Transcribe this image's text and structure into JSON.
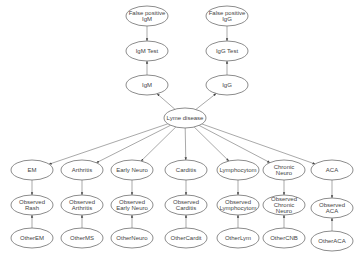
{
  "diagram": {
    "type": "bayesian-network",
    "background": "#ffffff",
    "stroke_color": "#6e6e6e",
    "text_color": "#444444",
    "nodes": [
      {
        "id": "fp_igm",
        "lines": [
          "False positive",
          "IgM"
        ],
        "cx": 147,
        "cy": 16,
        "rx": 21,
        "ry": 10
      },
      {
        "id": "igm_test",
        "lines": [
          "IgM Test"
        ],
        "cx": 147,
        "cy": 51,
        "rx": 21,
        "ry": 10
      },
      {
        "id": "igm",
        "lines": [
          "IgM"
        ],
        "cx": 147,
        "cy": 85,
        "rx": 21,
        "ry": 10
      },
      {
        "id": "fp_igg",
        "lines": [
          "False positive",
          "IgG"
        ],
        "cx": 227,
        "cy": 16,
        "rx": 21,
        "ry": 10
      },
      {
        "id": "igg_test",
        "lines": [
          "IgG Test"
        ],
        "cx": 227,
        "cy": 51,
        "rx": 21,
        "ry": 10
      },
      {
        "id": "igg",
        "lines": [
          "IgG"
        ],
        "cx": 227,
        "cy": 85,
        "rx": 21,
        "ry": 10
      },
      {
        "id": "lyme",
        "lines": [
          "Lyme disease"
        ],
        "cx": 185,
        "cy": 118,
        "rx": 21,
        "ry": 10
      },
      {
        "id": "em",
        "lines": [
          "EM"
        ],
        "cx": 32,
        "cy": 170,
        "rx": 21,
        "ry": 10
      },
      {
        "id": "arthritis",
        "lines": [
          "Arthritis"
        ],
        "cx": 82,
        "cy": 170,
        "rx": 21,
        "ry": 10
      },
      {
        "id": "early_neuro",
        "lines": [
          "Early Neuro"
        ],
        "cx": 132,
        "cy": 170,
        "rx": 21,
        "ry": 10
      },
      {
        "id": "carditis",
        "lines": [
          "Carditis"
        ],
        "cx": 186,
        "cy": 170,
        "rx": 21,
        "ry": 10
      },
      {
        "id": "lymphocytom",
        "lines": [
          "Lymphocytom"
        ],
        "cx": 238,
        "cy": 170,
        "rx": 21,
        "ry": 10
      },
      {
        "id": "chronic_neuro",
        "lines": [
          "Chronic",
          "Neuro"
        ],
        "cx": 284,
        "cy": 170,
        "rx": 21,
        "ry": 10
      },
      {
        "id": "aca",
        "lines": [
          "ACA"
        ],
        "cx": 332,
        "cy": 170,
        "rx": 21,
        "ry": 10
      },
      {
        "id": "obs_rash",
        "lines": [
          "Observed",
          "Rash"
        ],
        "cx": 32,
        "cy": 205,
        "rx": 21,
        "ry": 10
      },
      {
        "id": "obs_arthritis",
        "lines": [
          "Observed",
          "Arthritis"
        ],
        "cx": 82,
        "cy": 205,
        "rx": 21,
        "ry": 10
      },
      {
        "id": "obs_early_neuro",
        "lines": [
          "Observed",
          "Early Neuro"
        ],
        "cx": 132,
        "cy": 205,
        "rx": 21,
        "ry": 10
      },
      {
        "id": "obs_carditis",
        "lines": [
          "Observed",
          "Carditis"
        ],
        "cx": 186,
        "cy": 205,
        "rx": 21,
        "ry": 10
      },
      {
        "id": "obs_lymphocytom",
        "lines": [
          "Observed",
          "Lymphocytom"
        ],
        "cx": 238,
        "cy": 205,
        "rx": 21,
        "ry": 10
      },
      {
        "id": "obs_chronic_neuro",
        "lines": [
          "Observed",
          "Chronic",
          "Neuro"
        ],
        "cx": 284,
        "cy": 205,
        "rx": 21,
        "ry": 10
      },
      {
        "id": "obs_aca",
        "lines": [
          "Observed",
          "ACA"
        ],
        "cx": 332,
        "cy": 208,
        "rx": 21,
        "ry": 10
      },
      {
        "id": "other_em",
        "lines": [
          "OtherEM"
        ],
        "cx": 32,
        "cy": 238,
        "rx": 21,
        "ry": 10
      },
      {
        "id": "other_ms",
        "lines": [
          "OtherMS"
        ],
        "cx": 82,
        "cy": 238,
        "rx": 21,
        "ry": 10
      },
      {
        "id": "other_neuro",
        "lines": [
          "OtherNeuro"
        ],
        "cx": 132,
        "cy": 238,
        "rx": 21,
        "ry": 10
      },
      {
        "id": "other_cardit",
        "lines": [
          "OtherCardit"
        ],
        "cx": 186,
        "cy": 238,
        "rx": 21,
        "ry": 10
      },
      {
        "id": "other_lym",
        "lines": [
          "OtherLym"
        ],
        "cx": 238,
        "cy": 238,
        "rx": 21,
        "ry": 10
      },
      {
        "id": "other_cnb",
        "lines": [
          "OtherCNB"
        ],
        "cx": 284,
        "cy": 238,
        "rx": 21,
        "ry": 10
      },
      {
        "id": "other_aca",
        "lines": [
          "OtherACA"
        ],
        "cx": 332,
        "cy": 241,
        "rx": 21,
        "ry": 10
      }
    ],
    "edges": [
      {
        "from": "fp_igm",
        "to": "igm_test"
      },
      {
        "from": "igm",
        "to": "igm_test"
      },
      {
        "from": "fp_igg",
        "to": "igg_test"
      },
      {
        "from": "igg",
        "to": "igg_test"
      },
      {
        "from": "lyme",
        "to": "igm"
      },
      {
        "from": "lyme",
        "to": "igg"
      },
      {
        "from": "lyme",
        "to": "em"
      },
      {
        "from": "lyme",
        "to": "arthritis"
      },
      {
        "from": "lyme",
        "to": "early_neuro"
      },
      {
        "from": "lyme",
        "to": "carditis"
      },
      {
        "from": "lyme",
        "to": "lymphocytom"
      },
      {
        "from": "lyme",
        "to": "chronic_neuro"
      },
      {
        "from": "lyme",
        "to": "aca"
      },
      {
        "from": "em",
        "to": "obs_rash"
      },
      {
        "from": "arthritis",
        "to": "obs_arthritis"
      },
      {
        "from": "early_neuro",
        "to": "obs_early_neuro"
      },
      {
        "from": "carditis",
        "to": "obs_carditis"
      },
      {
        "from": "lymphocytom",
        "to": "obs_lymphocytom"
      },
      {
        "from": "chronic_neuro",
        "to": "obs_chronic_neuro"
      },
      {
        "from": "aca",
        "to": "obs_aca"
      },
      {
        "from": "other_em",
        "to": "obs_rash"
      },
      {
        "from": "other_ms",
        "to": "obs_arthritis"
      },
      {
        "from": "other_neuro",
        "to": "obs_early_neuro"
      },
      {
        "from": "other_cardit",
        "to": "obs_carditis"
      },
      {
        "from": "other_lym",
        "to": "obs_lymphocytom"
      },
      {
        "from": "other_cnb",
        "to": "obs_chronic_neuro"
      },
      {
        "from": "other_aca",
        "to": "obs_aca"
      }
    ]
  }
}
